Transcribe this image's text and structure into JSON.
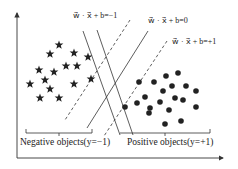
{
  "diagram": {
    "equations": {
      "minus_one": "w⃗ · x⃗ + b=−1",
      "zero": "w⃗ · x⃗ + b=0",
      "plus_one": "w⃗ · x⃗ + b=+1"
    },
    "captions": {
      "negative": "Negative objects(y=−1)",
      "positive": "Positive objects(y=+1)"
    },
    "colors": {
      "ink": "#222222",
      "axis": "#333333",
      "background": "#ffffff"
    },
    "negative_points": [
      [
        59,
        45
      ],
      [
        50,
        54
      ],
      [
        74,
        53
      ],
      [
        88,
        57
      ],
      [
        39,
        70
      ],
      [
        54,
        72
      ],
      [
        66,
        66
      ],
      [
        77,
        66
      ],
      [
        45,
        80
      ],
      [
        30,
        84
      ],
      [
        50,
        89
      ],
      [
        74,
        84
      ],
      [
        91,
        79
      ],
      [
        40,
        98
      ],
      [
        59,
        98
      ]
    ],
    "positive_points": [
      [
        178,
        73
      ],
      [
        166,
        76
      ],
      [
        139,
        82
      ],
      [
        154,
        82
      ],
      [
        172,
        86
      ],
      [
        186,
        86
      ],
      [
        163,
        91
      ],
      [
        196,
        91
      ],
      [
        145,
        97
      ],
      [
        175,
        98
      ],
      [
        137,
        103
      ],
      [
        160,
        102
      ],
      [
        183,
        100
      ],
      [
        125,
        107
      ],
      [
        150,
        108
      ],
      [
        196,
        107
      ],
      [
        169,
        110
      ],
      [
        149,
        113
      ],
      [
        181,
        121
      ],
      [
        165,
        124
      ]
    ]
  }
}
